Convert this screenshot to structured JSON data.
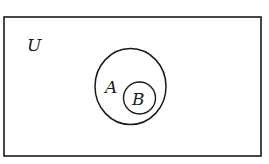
{
  "diagram": {
    "type": "venn",
    "universe": {
      "label": "U"
    },
    "sets": [
      {
        "label": "A",
        "contains": [
          "B"
        ]
      },
      {
        "label": "B",
        "subset_of": "A"
      }
    ],
    "colors": {
      "stroke": "#1a1a1a",
      "background": "#ffffff"
    }
  }
}
